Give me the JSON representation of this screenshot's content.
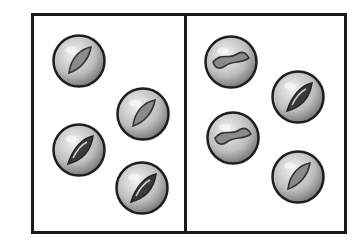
{
  "figure": {
    "colors": {
      "border": "#1a1a1a",
      "marble_light": "#e6e6e6",
      "marble_mid": "#9a9a9a",
      "marble_dark": "#3a3a3a"
    },
    "panels": [
      {
        "name": "left-box",
        "marble_count": 4,
        "marbles": [
          {
            "cx": 79,
            "cy": 61,
            "style": "swirl-light"
          },
          {
            "cx": 143,
            "cy": 114,
            "style": "swirl-light"
          },
          {
            "cx": 79,
            "cy": 150,
            "style": "swirl-dark"
          },
          {
            "cx": 142,
            "cy": 188,
            "style": "swirl-dark"
          }
        ]
      },
      {
        "name": "right-box",
        "marble_count": 4,
        "marbles": [
          {
            "cx": 231,
            "cy": 62,
            "style": "swirl-wave"
          },
          {
            "cx": 298,
            "cy": 97,
            "style": "swirl-dark"
          },
          {
            "cx": 233,
            "cy": 138,
            "style": "swirl-wave"
          },
          {
            "cx": 298,
            "cy": 177,
            "style": "swirl-light"
          }
        ]
      }
    ]
  }
}
